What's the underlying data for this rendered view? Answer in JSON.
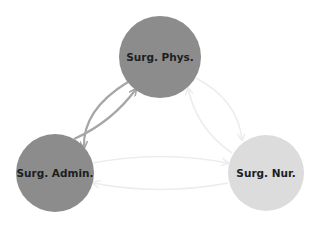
{
  "diagram": {
    "type": "directed-network",
    "nodes": [
      {
        "id": "phys",
        "label": "Surg. Phys.",
        "cx": 160,
        "cy": 57,
        "r": 41,
        "color": "#8c8c8c"
      },
      {
        "id": "admin",
        "label": "Surg. Admin.",
        "cx": 55,
        "cy": 173,
        "r": 39,
        "color": "#8c8c8c"
      },
      {
        "id": "nur",
        "label": "Surg. Nur.",
        "cx": 266,
        "cy": 173,
        "r": 38,
        "color": "#dcdcdc"
      }
    ],
    "edges": [
      {
        "from": "phys",
        "to": "admin",
        "color": "#a6a6a6",
        "width": 2.2
      },
      {
        "from": "admin",
        "to": "phys",
        "color": "#a6a6a6",
        "width": 2.2
      },
      {
        "from": "phys",
        "to": "nur",
        "color": "#ededed",
        "width": 1.6
      },
      {
        "from": "nur",
        "to": "phys",
        "color": "#ededed",
        "width": 1.6
      },
      {
        "from": "admin",
        "to": "nur",
        "color": "#ececec",
        "width": 1.6
      },
      {
        "from": "nur",
        "to": "admin",
        "color": "#ececec",
        "width": 1.6
      }
    ]
  }
}
